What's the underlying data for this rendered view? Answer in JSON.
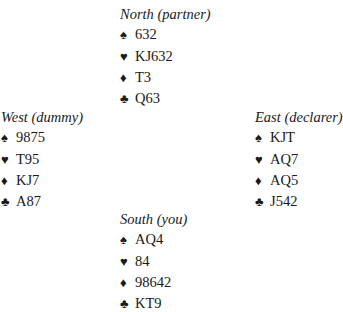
{
  "suits": {
    "spades": "♠",
    "hearts": "♥",
    "diamonds": "♦",
    "clubs": "♣"
  },
  "hands": {
    "north": {
      "title": "North (partner)",
      "spades": "632",
      "hearts": "KJ632",
      "diamonds": "T3",
      "clubs": "Q63"
    },
    "west": {
      "title": "West (dummy)",
      "spades": "9875",
      "hearts": "T95",
      "diamonds": "KJ7",
      "clubs": "A87"
    },
    "east": {
      "title": "East (declarer)",
      "spades": "KJT",
      "hearts": "AQ7",
      "diamonds": "AQ5",
      "clubs": "J542"
    },
    "south": {
      "title": "South (you)",
      "spades": "AQ4",
      "hearts": "84",
      "diamonds": "98642",
      "clubs": "KT9"
    }
  }
}
